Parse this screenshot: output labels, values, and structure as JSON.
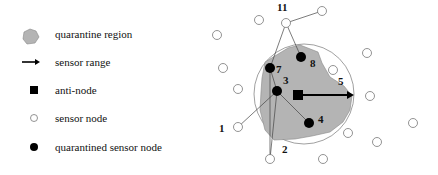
{
  "legend": {
    "items": [
      {
        "icon": "quarantine-region-icon",
        "label": "quarantine region"
      },
      {
        "icon": "arrow-icon",
        "label": "sensor range"
      },
      {
        "icon": "filled-square-icon",
        "label": "anti-node"
      },
      {
        "icon": "hollow-circle-icon",
        "label": "sensor node"
      },
      {
        "icon": "filled-circle-icon",
        "label": "quarantined sensor node"
      }
    ]
  },
  "diagram": {
    "node_labels": {
      "n1": "1",
      "n2": "2",
      "n3": "3",
      "n4": "4",
      "n5": "5",
      "n7": "7",
      "n8": "8",
      "n11": "11"
    },
    "colors": {
      "region_fill": "#b4b4b4",
      "stroke": "#555555",
      "node": "#000000"
    }
  }
}
